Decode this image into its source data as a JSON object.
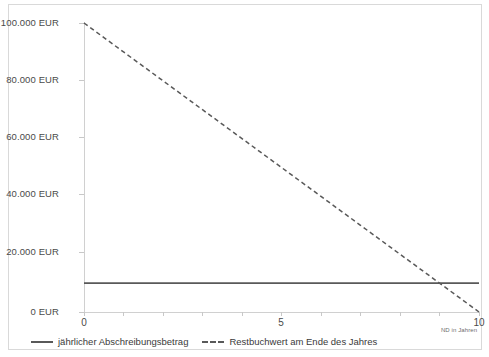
{
  "chart_data": {
    "type": "line",
    "title": "",
    "xlabel": "ND in Jahren",
    "ylabel": "",
    "xlim": [
      0,
      10
    ],
    "ylim": [
      0,
      100000
    ],
    "grid": false,
    "legend_position": "bottom-left",
    "x": [
      0,
      1,
      2,
      3,
      4,
      5,
      6,
      7,
      8,
      9,
      10
    ],
    "x_tick_labels": [
      "0",
      "5",
      "10"
    ],
    "x_tick_values": [
      0,
      5,
      10
    ],
    "x_minor_ticks": [
      0,
      1,
      2,
      3,
      4,
      5,
      6,
      7,
      8,
      9,
      10
    ],
    "y_tick_labels": [
      "100.000 EUR",
      "80.000 EUR",
      "60.000 EUR",
      "40.000 EUR",
      "20.000 EUR",
      "0 EUR"
    ],
    "y_tick_values": [
      100000,
      80000,
      60000,
      40000,
      20000,
      0
    ],
    "series": [
      {
        "name": "jährlicher Abschreibungsbetrag",
        "style": "solid",
        "color": "#595959",
        "values": [
          10000,
          10000,
          10000,
          10000,
          10000,
          10000,
          10000,
          10000,
          10000,
          10000,
          10000
        ]
      },
      {
        "name": "Restbuchwert am Ende des Jahres",
        "style": "dashed",
        "color": "#595959",
        "values": [
          100000,
          90000,
          80000,
          70000,
          60000,
          50000,
          40000,
          30000,
          20000,
          10000,
          0
        ]
      }
    ]
  },
  "legend": {
    "entries": [
      {
        "label": "jährlicher Abschreibungsbetrag",
        "style": "solid"
      },
      {
        "label": "Restbuchwert am Ende des Jahres",
        "style": "dashed"
      }
    ]
  },
  "axis": {
    "x_title": "ND in Jahren",
    "y_labels": {
      "t0": "100.000 EUR",
      "t1": "80.000 EUR",
      "t2": "60.000 EUR",
      "t3": "40.000 EUR",
      "t4": "20.000 EUR",
      "t5": "0 EUR"
    },
    "x_labels": {
      "t0": "0",
      "t1": "5",
      "t2": "10"
    }
  },
  "colors": {
    "series_line": "#595959",
    "axis_line": "#d0d0d0",
    "frame_border": "#d9d9d9",
    "tick_text": "#4a4a4a"
  }
}
